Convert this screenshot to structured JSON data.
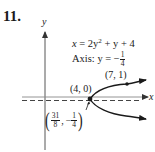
{
  "problem": {
    "number": "11."
  },
  "axes": {
    "x_label": "x",
    "y_label": "y"
  },
  "equation": {
    "lhs": "x",
    "rhs_prefix": " = 2y",
    "exponent": "2",
    "rhs_suffix": " + y + 4"
  },
  "axis_of_symmetry": {
    "prefix": "Axis: y = −",
    "frac_num": "1",
    "frac_den": "4"
  },
  "points": {
    "intercept": {
      "label": "(4, 0)",
      "x": 4,
      "y": 0
    },
    "point": {
      "label": "(7, 1)",
      "x": 7,
      "y": 1
    },
    "vertex": {
      "x_num": "31",
      "x_den": "8",
      "y_sign": "−",
      "y_num": "1",
      "y_den": "4",
      "separator": ","
    }
  },
  "colors": {
    "ink": "#1a1a1a",
    "axis_gray": "#555555",
    "dashed": "#444444"
  }
}
